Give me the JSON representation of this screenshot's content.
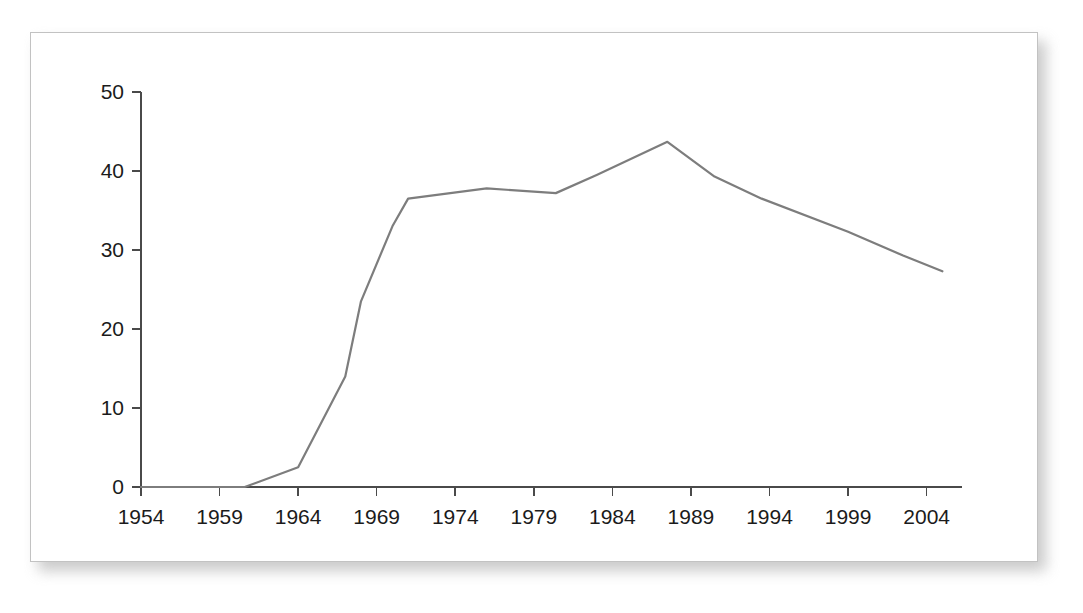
{
  "chart_data": {
    "type": "line",
    "title": "",
    "subtitle": "",
    "xlabel": "",
    "ylabel": "",
    "xlim": [
      1954,
      2006
    ],
    "ylim": [
      0,
      50
    ],
    "grid": false,
    "legend": null,
    "legend_position": "none",
    "xticks": [
      1954,
      1959,
      1964,
      1969,
      1974,
      1979,
      1984,
      1989,
      1994,
      1999,
      2004
    ],
    "xtick_labels": [
      "1954",
      "1959",
      "1964",
      "1969",
      "1974",
      "1979",
      "1984",
      "1989",
      "1994",
      "1999",
      "2004"
    ],
    "yticks": [
      0,
      10,
      20,
      30,
      40,
      50
    ],
    "ytick_labels": [
      "0",
      "10",
      "20",
      "30",
      "40",
      "50"
    ],
    "series": [
      {
        "name": "series-1",
        "color": "#7d7d7d",
        "line_width": 2.2,
        "marker": "none",
        "x": [
          1954,
          1959,
          1960.6,
          1964,
          1967,
          1968,
          1970,
          1971,
          1976,
          1980.4,
          1983,
          1987.5,
          1990.5,
          1993.5,
          1999,
          2002.5,
          2005
        ],
        "y": [
          0,
          0,
          0,
          2.5,
          14.0,
          23.5,
          33.0,
          36.5,
          37.8,
          37.2,
          39.5,
          43.7,
          39.3,
          36.5,
          32.3,
          29.3,
          27.3
        ]
      }
    ]
  },
  "axes": {
    "axis_color": "#4a4a4a",
    "tick_label_color": "#1b1b1b",
    "tick_label_size_px": 21
  },
  "panel": {
    "background": "#ffffff",
    "border_color": "#c2c2c2",
    "shadow_color": "#b9b9b9"
  }
}
